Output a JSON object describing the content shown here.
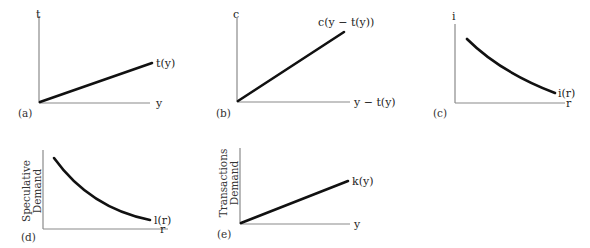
{
  "panels": [
    {
      "id": "a",
      "panel_label": "(a)",
      "y_axis_label": "t",
      "x_axis_label": "y",
      "curve_label": "t(y)",
      "curve_shape": "increasing-linear"
    },
    {
      "id": "b",
      "panel_label": "(b)",
      "y_axis_label": "c",
      "x_axis_label": "y − t(y)",
      "curve_label": "c(y − t(y))",
      "curve_shape": "increasing-linear-steep"
    },
    {
      "id": "c",
      "panel_label": "(c)",
      "y_axis_label": "i",
      "x_axis_label": "r",
      "curve_label": "i(r)",
      "curve_shape": "decreasing-convex"
    },
    {
      "id": "d",
      "panel_label": "(d)",
      "y_axis_label_line1": "Speculative",
      "y_axis_label_line2": "Demand",
      "x_axis_label": "r",
      "curve_label": "l(r)",
      "curve_shape": "decreasing-convex"
    },
    {
      "id": "e",
      "panel_label": "(e)",
      "y_axis_label_line1": "Transactions",
      "y_axis_label_line2": "Demand",
      "x_axis_label": "y",
      "curve_label": "k(y)",
      "curve_shape": "increasing-linear"
    }
  ],
  "colors": {
    "axis": "#8a8a8a",
    "curve": "#111111",
    "text": "#222222",
    "background": "#ffffff"
  }
}
